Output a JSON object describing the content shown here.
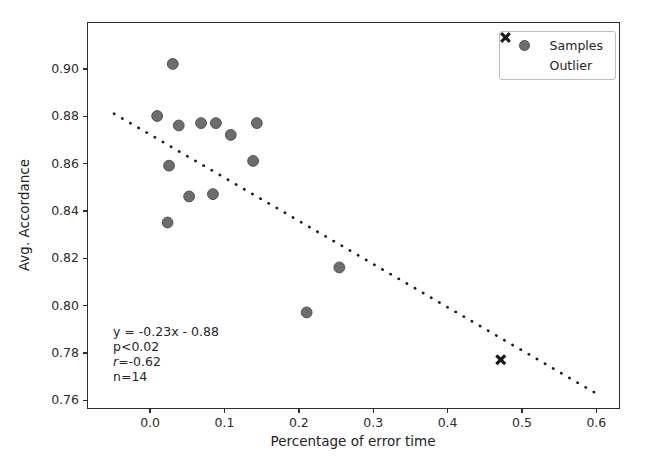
{
  "chart_data": {
    "type": "scatter",
    "title": "",
    "xlabel": "Percentage of error time",
    "ylabel": "Avg. Accordance",
    "xlim": [
      -0.083,
      0.631
    ],
    "ylim": [
      0.7566,
      0.9193
    ],
    "grid": false,
    "x_tick_values": [
      0.0,
      0.1,
      0.2,
      0.3,
      0.4,
      0.5,
      0.6
    ],
    "x_tick_labels": [
      "0.0",
      "0.1",
      "0.2",
      "0.3",
      "0.4",
      "0.5",
      "0.6"
    ],
    "y_tick_values": [
      0.76,
      0.78,
      0.8,
      0.82,
      0.84,
      0.86,
      0.88,
      0.9
    ],
    "y_tick_labels": [
      "0.76",
      "0.78",
      "0.80",
      "0.82",
      "0.84",
      "0.86",
      "0.88",
      "0.90"
    ],
    "series": [
      {
        "name": "Samples",
        "marker": "circle",
        "color": "#6d6d6d",
        "edge_color": "#515151",
        "points": [
          [
            0.031,
            0.902
          ],
          [
            0.01,
            0.88
          ],
          [
            0.039,
            0.876
          ],
          [
            0.069,
            0.877
          ],
          [
            0.089,
            0.877
          ],
          [
            0.109,
            0.872
          ],
          [
            0.144,
            0.877
          ],
          [
            0.026,
            0.859
          ],
          [
            0.139,
            0.861
          ],
          [
            0.053,
            0.846
          ],
          [
            0.085,
            0.847
          ],
          [
            0.024,
            0.835
          ],
          [
            0.211,
            0.797
          ],
          [
            0.255,
            0.816
          ]
        ]
      },
      {
        "name": "Outlier",
        "marker": "X",
        "color": "#1a1a1a",
        "edge_color": "#1a1a1a",
        "points": [
          [
            0.472,
            0.777
          ]
        ]
      }
    ],
    "trendline": {
      "style": "dotted",
      "color": "#1a1a1a",
      "from": [
        -0.048,
        0.881
      ],
      "to": [
        0.599,
        0.763
      ]
    },
    "legend": {
      "position": "upper right",
      "entries": [
        "Samples",
        "Outlier"
      ]
    },
    "annotation": {
      "lines": [
        {
          "text": "y = -0.23x - 0.88",
          "italic_first": false
        },
        {
          "text": "p<0.02",
          "italic_first": false
        },
        {
          "text": "r=-0.62",
          "italic_first": true
        },
        {
          "text": "n=14",
          "italic_first": false
        }
      ]
    }
  }
}
